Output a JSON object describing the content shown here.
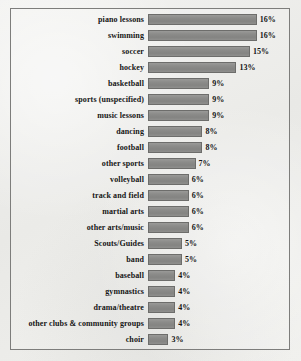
{
  "chart": {
    "type": "bar",
    "title": "",
    "frame_visible": true
  },
  "chart_data": {
    "type": "bar",
    "orientation": "horizontal",
    "title": "",
    "subtitle": "",
    "xlabel": "",
    "ylabel": "",
    "xlim": [
      0,
      16
    ],
    "grid": false,
    "legend": false,
    "value_suffix": "%",
    "categories": [
      "piano lessons",
      "swimming",
      "soccer",
      "hockey",
      "basketball",
      "sports (unspecified)",
      "music lessons",
      "dancing",
      "football",
      "other sports",
      "volleyball",
      "track and field",
      "martial arts",
      "other arts/music",
      "Scouts/Guides",
      "band",
      "baseball",
      "gymnastics",
      "drama/theatre",
      "other clubs & community groups",
      "choir"
    ],
    "values": [
      16,
      16,
      15,
      13,
      9,
      9,
      9,
      8,
      8,
      7,
      6,
      6,
      6,
      6,
      5,
      5,
      4,
      4,
      4,
      4,
      3
    ],
    "value_labels": [
      "16%",
      "16%",
      "15%",
      "13%",
      "9%",
      "9%",
      "9%",
      "8%",
      "8%",
      "7%",
      "6%",
      "6%",
      "6%",
      "6%",
      "5%",
      "5%",
      "4%",
      "4%",
      "4%",
      "4%",
      "3%"
    ],
    "colors": {
      "bar_fill": "#8b8b89",
      "bar_border": "#6d6d6b",
      "background": "#efefec",
      "frame": "#7d7d7b",
      "text": "#151515"
    }
  }
}
